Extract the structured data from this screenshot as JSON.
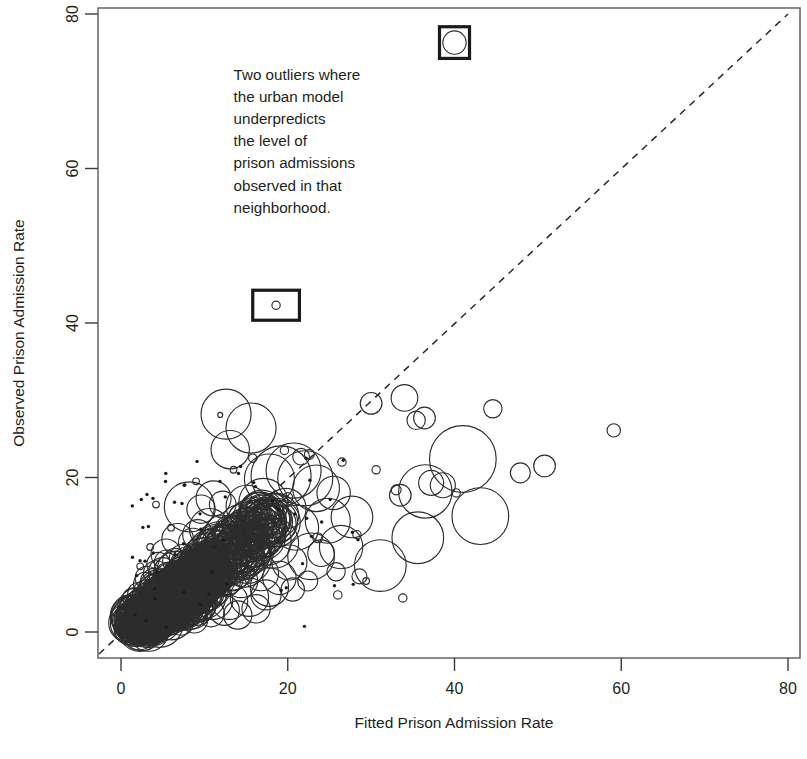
{
  "chart_data": {
    "type": "scatter",
    "title": "",
    "xlabel": "Fitted Prison Admission Rate",
    "ylabel": "Observed Prison Admission Rate",
    "xlim": [
      0,
      80
    ],
    "ylim": [
      0,
      80
    ],
    "xticks": [
      0,
      20,
      40,
      60,
      80
    ],
    "yticks": [
      0,
      20,
      40,
      60,
      80
    ],
    "xtick_labels": [
      "0",
      "20",
      "40",
      "60",
      "80"
    ],
    "ytick_labels": [
      "0",
      "20",
      "40",
      "60",
      "80"
    ],
    "grid": false,
    "legend": "none",
    "marker": "open-circle-bubble",
    "size_encoding": "bubble radius encodes neighborhood population weight",
    "reference_line": {
      "type": "diagonal",
      "style": "dashed",
      "from": [
        0,
        0
      ],
      "to": [
        80,
        80
      ],
      "label": "y = x (perfect prediction)"
    },
    "annotations": [
      {
        "text": "Two outliers where the urban model underpredicts the level of prison admissions observed in that neighborhood.",
        "lines": [
          "Two outliers where",
          "the urban model",
          "underpredicts",
          "the level of",
          "prison admissions",
          "observed in that",
          "neighborhood."
        ],
        "x": 13.5,
        "y": 71.5
      }
    ],
    "highlight_boxes": [
      {
        "name": "outlier-box-top",
        "cx": 40.0,
        "cy": 76.3,
        "w": 3.6,
        "h": 3.8
      },
      {
        "name": "outlier-box-mid",
        "cx": 18.6,
        "cy": 42.3,
        "w": 5.6,
        "h": 3.6
      }
    ],
    "series": [
      {
        "name": "Neighborhoods",
        "points": [
          [
            40.0,
            76.3,
            1.4
          ],
          [
            18.6,
            42.3,
            0.5
          ],
          [
            12.6,
            28.2,
            3.0
          ],
          [
            15.6,
            26.4,
            3.0
          ],
          [
            13.1,
            23.6,
            2.3
          ],
          [
            34.0,
            30.3,
            1.6
          ],
          [
            36.4,
            27.7,
            1.3
          ],
          [
            35.4,
            27.4,
            1.1
          ],
          [
            30.0,
            29.6,
            1.3
          ],
          [
            44.6,
            28.9,
            1.1
          ],
          [
            59.1,
            26.1,
            0.8
          ],
          [
            50.8,
            21.5,
            1.3
          ],
          [
            47.9,
            20.6,
            1.2
          ],
          [
            41.0,
            22.4,
            4.0
          ],
          [
            43.1,
            15.0,
            3.4
          ],
          [
            38.6,
            19.0,
            1.5
          ],
          [
            37.2,
            19.3,
            1.5
          ],
          [
            36.5,
            18.2,
            3.2
          ],
          [
            33.5,
            17.7,
            1.3
          ],
          [
            35.6,
            12.2,
            3.1
          ],
          [
            31.1,
            8.6,
            3.1
          ],
          [
            33.8,
            4.4,
            0.5
          ],
          [
            22.1,
            19.9,
            3.3
          ],
          [
            23.4,
            18.6,
            2.8
          ],
          [
            25.5,
            18.0,
            2.0
          ],
          [
            27.7,
            14.9,
            2.5
          ],
          [
            24.8,
            14.4,
            2.7
          ],
          [
            26.4,
            11.0,
            2.6
          ],
          [
            28.6,
            7.2,
            0.9
          ],
          [
            21.6,
            22.7,
            1.0
          ],
          [
            20.7,
            20.9,
            3.3
          ],
          [
            19.2,
            20.2,
            3.6
          ],
          [
            17.8,
            19.8,
            3.0
          ],
          [
            19.8,
            16.0,
            2.4
          ],
          [
            21.0,
            13.5,
            2.7
          ],
          [
            22.8,
            9.8,
            2.8
          ],
          [
            18.3,
            11.5,
            3.0
          ],
          [
            16.4,
            15.7,
            2.2
          ],
          [
            15.1,
            16.3,
            2.5
          ],
          [
            14.2,
            14.2,
            2.1
          ],
          [
            13.5,
            12.1,
            2.6
          ],
          [
            12.2,
            16.5,
            1.6
          ],
          [
            11.1,
            17.3,
            2.1
          ],
          [
            9.6,
            15.9,
            1.7
          ],
          [
            8.2,
            16.2,
            3.0
          ],
          [
            10.6,
            13.4,
            2.4
          ],
          [
            11.8,
            11.2,
            2.2
          ],
          [
            10.2,
            10.0,
            2.5
          ],
          [
            12.9,
            9.4,
            2.3
          ],
          [
            14.8,
            8.4,
            2.4
          ],
          [
            16.8,
            7.6,
            2.1
          ],
          [
            17.8,
            5.8,
            2.3
          ],
          [
            15.4,
            4.5,
            2.3
          ],
          [
            13.0,
            4.0,
            2.2
          ],
          [
            11.0,
            4.2,
            2.4
          ],
          [
            9.0,
            5.2,
            2.3
          ],
          [
            7.6,
            6.6,
            2.2
          ],
          [
            6.4,
            8.3,
            2.0
          ],
          [
            5.4,
            10.1,
            1.8
          ],
          [
            6.8,
            12.0,
            1.9
          ],
          [
            8.6,
            11.6,
            1.7
          ],
          [
            9.4,
            8.8,
            1.9
          ],
          [
            7.4,
            9.6,
            1.6
          ],
          [
            5.8,
            7.0,
            1.9
          ],
          [
            4.6,
            5.6,
            1.9
          ],
          [
            3.6,
            4.0,
            1.8
          ],
          [
            2.8,
            2.6,
            1.7
          ],
          [
            2.0,
            1.6,
            1.6
          ],
          [
            3.2,
            1.2,
            1.6
          ],
          [
            4.4,
            2.0,
            1.7
          ],
          [
            5.6,
            3.1,
            1.8
          ],
          [
            6.6,
            4.4,
            1.8
          ],
          [
            7.8,
            3.4,
            1.8
          ],
          [
            6.0,
            1.9,
            1.7
          ],
          [
            4.8,
            0.9,
            1.6
          ],
          [
            3.4,
            0.5,
            1.5
          ],
          [
            2.2,
            0.4,
            1.4
          ],
          [
            1.6,
            1.0,
            1.3
          ],
          [
            1.2,
            2.2,
            1.2
          ],
          [
            2.4,
            3.5,
            1.5
          ],
          [
            3.0,
            5.0,
            1.6
          ],
          [
            4.0,
            6.4,
            1.7
          ],
          [
            5.0,
            7.8,
            1.7
          ],
          [
            6.2,
            6.0,
            1.8
          ],
          [
            7.0,
            5.0,
            1.8
          ],
          [
            8.2,
            4.0,
            1.8
          ],
          [
            9.6,
            3.2,
            1.7
          ],
          [
            10.8,
            2.4,
            1.6
          ],
          [
            8.8,
            1.6,
            1.6
          ],
          [
            7.2,
            1.2,
            1.5
          ],
          [
            5.2,
            1.4,
            1.5
          ],
          [
            3.8,
            2.8,
            1.6
          ],
          [
            2.6,
            4.2,
            1.4
          ],
          [
            1.8,
            3.2,
            1.3
          ],
          [
            1.4,
            4.4,
            1.2
          ],
          [
            2.9,
            6.2,
            1.4
          ],
          [
            4.2,
            7.6,
            1.5
          ],
          [
            5.5,
            9.0,
            1.5
          ],
          [
            6.9,
            7.6,
            1.6
          ],
          [
            8.4,
            6.8,
            1.7
          ],
          [
            9.9,
            6.0,
            1.6
          ],
          [
            11.4,
            5.2,
            1.6
          ],
          [
            12.6,
            6.4,
            1.7
          ],
          [
            11.6,
            7.8,
            1.7
          ],
          [
            10.0,
            7.2,
            1.6
          ],
          [
            8.0,
            8.0,
            1.6
          ],
          [
            6.5,
            9.2,
            1.5
          ],
          [
            5.1,
            5.2,
            1.6
          ],
          [
            3.9,
            3.4,
            1.5
          ],
          [
            2.7,
            1.9,
            1.4
          ],
          [
            1.9,
            0.8,
            1.3
          ],
          [
            1.1,
            0.5,
            1.2
          ],
          [
            0.9,
            1.5,
            1.1
          ],
          [
            1.5,
            2.6,
            1.2
          ],
          [
            2.1,
            5.0,
            1.3
          ],
          [
            3.1,
            7.0,
            1.4
          ],
          [
            4.5,
            8.8,
            1.4
          ],
          [
            9.2,
            12.6,
            1.8
          ],
          [
            10.4,
            11.0,
            1.7
          ],
          [
            12.0,
            13.0,
            1.9
          ],
          [
            13.8,
            10.4,
            2.0
          ],
          [
            15.0,
            11.8,
            2.0
          ],
          [
            16.0,
            10.2,
            2.0
          ],
          [
            14.4,
            6.6,
            2.0
          ],
          [
            12.4,
            2.8,
            1.8
          ],
          [
            14.0,
            2.2,
            1.7
          ],
          [
            16.2,
            3.0,
            1.7
          ],
          [
            17.4,
            4.8,
            1.8
          ],
          [
            19.0,
            7.0,
            2.0
          ],
          [
            20.2,
            9.0,
            2.1
          ],
          [
            18.8,
            14.0,
            2.2
          ],
          [
            17.0,
            13.0,
            2.0
          ],
          [
            20.6,
            5.5,
            1.4
          ],
          [
            22.4,
            6.6,
            1.2
          ],
          [
            24.0,
            10.2,
            1.6
          ],
          [
            25.8,
            7.8,
            1.1
          ],
          [
            3.5,
            11.0,
            0.4
          ],
          [
            6.0,
            13.5,
            0.4
          ],
          [
            9.0,
            19.5,
            0.4
          ],
          [
            13.5,
            21.0,
            0.4
          ],
          [
            15.8,
            22.5,
            0.5
          ],
          [
            19.6,
            23.5,
            0.5
          ],
          [
            22.6,
            23.0,
            0.6
          ],
          [
            26.5,
            22.0,
            0.5
          ],
          [
            4.2,
            16.5,
            0.4
          ],
          [
            2.3,
            8.5,
            0.4
          ],
          [
            20.0,
            17.4,
            0.6
          ],
          [
            23.6,
            12.2,
            0.6
          ],
          [
            28.3,
            12.6,
            0.5
          ],
          [
            33.0,
            18.4,
            0.6
          ],
          [
            30.6,
            21.0,
            0.5
          ],
          [
            11.9,
            28.1,
            0.3
          ],
          [
            40.2,
            18.0,
            0.5
          ],
          [
            26.0,
            4.8,
            0.5
          ],
          [
            29.4,
            6.6,
            0.4
          ]
        ]
      }
    ]
  },
  "axes": {
    "x_title": "Fitted Prison Admission Rate",
    "y_title": "Observed Prison Admission Rate"
  }
}
